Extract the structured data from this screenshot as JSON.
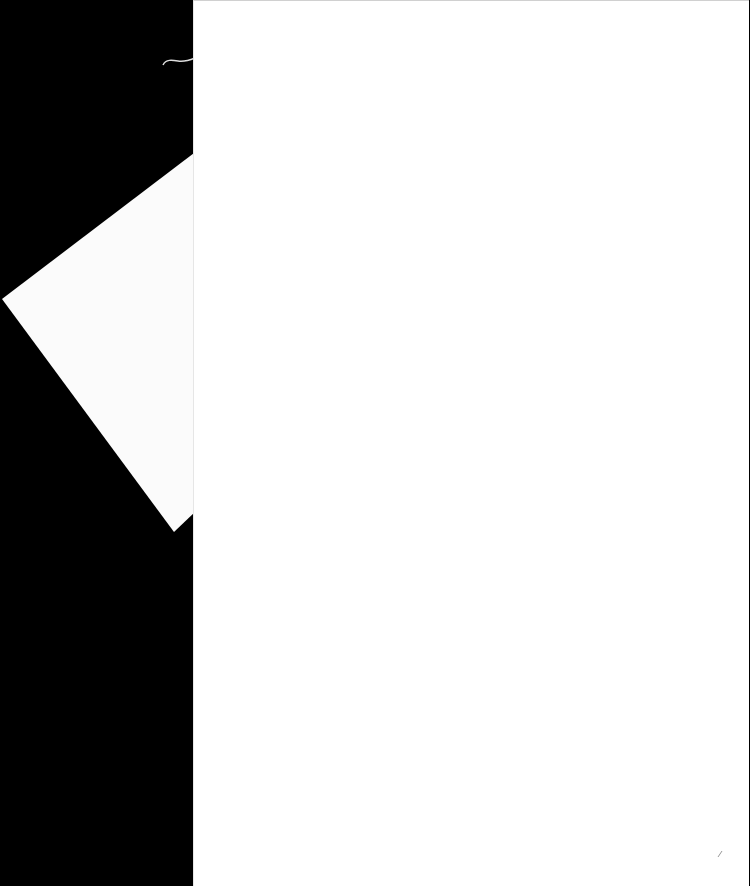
{
  "document": {
    "type": "scanned blank pages",
    "background_color": "#000000",
    "paper_color": "#ffffff",
    "pages": [
      {
        "id": "back",
        "text": ""
      },
      {
        "id": "front",
        "text": ""
      }
    ]
  }
}
